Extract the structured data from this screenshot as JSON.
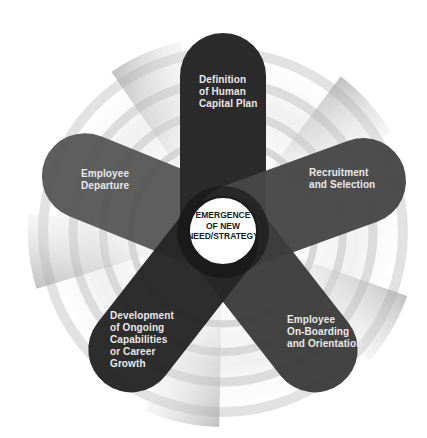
{
  "diagram": {
    "type": "radial-cycle",
    "center": {
      "label": "EMERGENCE\nOF NEW\nNEED/STRATEGY"
    },
    "petals": [
      {
        "label": "Definition\nof Human\nCapital Plan",
        "position": "top"
      },
      {
        "label": "Recruitment\nand Selection",
        "position": "right"
      },
      {
        "label": "Employee\nOn-Boarding\nand Orientation",
        "position": "bottom-right"
      },
      {
        "label": "Development\nof Ongoing\nCapabilities\nor Career\nGrowth",
        "position": "bottom-left"
      },
      {
        "label": "Employee\nDeparture",
        "position": "left"
      }
    ],
    "colors": {
      "petal_dark": "#2a2a2a",
      "petal_mid": "#3e3e3e",
      "petal_light": "#505050",
      "center_fill": "#ffffff",
      "ring": "#d8d8d8",
      "text_light": "#e9e9e9",
      "text_dark": "#1a1a1a"
    }
  }
}
